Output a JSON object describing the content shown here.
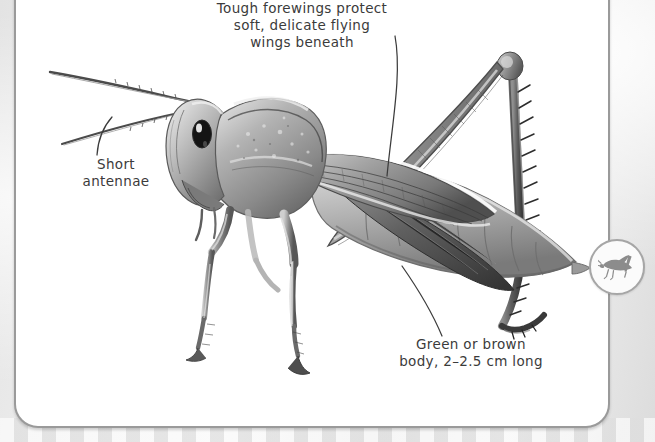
{
  "page": {
    "background_color": "#e8e8e8",
    "panel_background": "#ffffff",
    "panel_border_color": "#9a9a9a"
  },
  "illustration": {
    "subject": "grasshopper",
    "style": "grayscale pencil/photographic side view",
    "facing": "left"
  },
  "callouts": [
    {
      "id": "forewings",
      "text": "Tough forewings protect\nsoft, delicate flying\nwings beneath",
      "leader": "curved line from label down-left to the forewing"
    },
    {
      "id": "antennae",
      "text": "Short\nantennae",
      "leader": "curved line from label up-right to the antenna base"
    },
    {
      "id": "body",
      "text": "Green or brown\nbody, 2–2.5 cm long",
      "leader": "curved line from label up-left to the abdomen"
    }
  ],
  "badge": {
    "icon_name": "grasshopper-icon",
    "color": "#8c8c8c",
    "ring_color": "#a6a6a6"
  }
}
